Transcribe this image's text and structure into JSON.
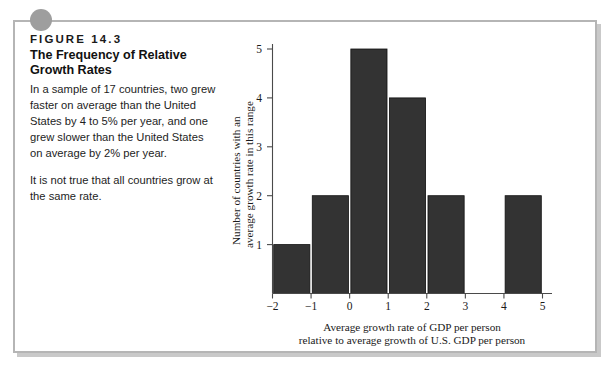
{
  "figure": {
    "number": "FIGURE  14.3",
    "title_line1": "The Frequency of Relative",
    "title_line2": "Growth Rates",
    "caption_1": "In a sample of 17 countries, two grew faster on average than the United States by 4 to 5% per year, and one grew slower than the United States on average by 2% per year.",
    "caption_2": "It is not true that all countries grow at the same rate.",
    "frame_border_color": "#b5b5b5",
    "corner_dot_color": "#9e9e9e",
    "bar_color": "#333333"
  },
  "chart_data": {
    "type": "bar",
    "title": "",
    "xlabel_line1": "Average growth rate of GDP per person",
    "xlabel_line2": "relative to average growth of U.S. GDP per person",
    "ylabel_line1": "Number of countries with an",
    "ylabel_line2": "average growth rate in this range",
    "x_ticks": [
      "−2",
      "−1",
      "0",
      "1",
      "2",
      "3",
      "4",
      "5"
    ],
    "x_tick_values": [
      -2,
      -1,
      0,
      1,
      2,
      3,
      4,
      5
    ],
    "y_ticks": [
      "1",
      "2",
      "3",
      "4",
      "5"
    ],
    "y_tick_values": [
      1,
      2,
      3,
      4,
      5
    ],
    "xlim": [
      -2,
      5
    ],
    "ylim": [
      0,
      5
    ],
    "grid": false,
    "legend": "none",
    "bins": [
      {
        "from": -2,
        "to": -1,
        "count": 1
      },
      {
        "from": -1,
        "to": 0,
        "count": 2
      },
      {
        "from": 0,
        "to": 1,
        "count": 5
      },
      {
        "from": 1,
        "to": 2,
        "count": 4
      },
      {
        "from": 2,
        "to": 3,
        "count": 2
      },
      {
        "from": 3,
        "to": 4,
        "count": 0
      },
      {
        "from": 4,
        "to": 5,
        "count": 2
      }
    ],
    "categories": [
      "-2 to -1",
      "-1 to 0",
      "0 to 1",
      "1 to 2",
      "2 to 3",
      "3 to 4",
      "4 to 5"
    ],
    "values": [
      1,
      2,
      5,
      4,
      0,
      2,
      2
    ]
  }
}
